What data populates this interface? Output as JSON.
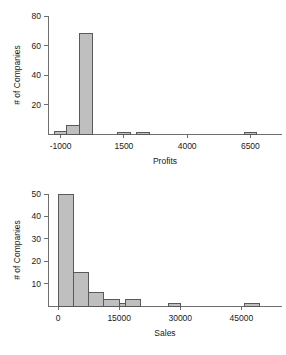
{
  "figure": {
    "title": "",
    "background": "#ffffff",
    "bar_fill": "#bfbfbf",
    "bar_stroke": "#595959",
    "axis_color": "#6e6e6e"
  },
  "chart_data": [
    {
      "id": "profits",
      "type": "bar",
      "title": "",
      "xlabel": "Profits",
      "ylabel": "# of Companies",
      "grid": false,
      "legend": "none",
      "xlim": [
        -1500,
        7750
      ],
      "ylim": [
        0,
        80
      ],
      "xticks": [
        -1000,
        1500,
        4000,
        6500
      ],
      "xtick_labels": [
        "-1000",
        "1500",
        "4000",
        "6500"
      ],
      "yticks": [
        20,
        40,
        60,
        80
      ],
      "ytick_labels": [
        "20",
        "40",
        "60",
        "80"
      ],
      "bin_width": 500,
      "bins": [
        {
          "x0": -1250,
          "x1": -750,
          "value": 2
        },
        {
          "x0": -750,
          "x1": -250,
          "value": 6
        },
        {
          "x0": -250,
          "x1": 250,
          "value": 68
        },
        {
          "x0": 1250,
          "x1": 1750,
          "value": 1
        },
        {
          "x0": 2000,
          "x1": 2500,
          "value": 1
        },
        {
          "x0": 6250,
          "x1": 6750,
          "value": 1
        }
      ],
      "categories": [
        "-1250 to -750",
        "-750 to -250",
        "-250 to 250",
        "1250 to 1750",
        "2000 to 2500",
        "6250 to 6750"
      ],
      "values": [
        2,
        6,
        68,
        1,
        1,
        1
      ]
    },
    {
      "id": "sales",
      "type": "bar",
      "title": "",
      "xlabel": "Sales",
      "ylabel": "# of Companies",
      "grid": false,
      "legend": "none",
      "xlim": [
        -2500,
        55000
      ],
      "ylim": [
        0,
        50
      ],
      "xticks": [
        0,
        15000,
        30000,
        45000
      ],
      "xtick_labels": [
        "0",
        "15000",
        "30000",
        "45000"
      ],
      "yticks": [
        10,
        20,
        30,
        40,
        50
      ],
      "ytick_labels": [
        "10",
        "20",
        "30",
        "40",
        "50"
      ],
      "bin_width": 3750,
      "bins": [
        {
          "x0": 0,
          "x1": 3750,
          "value": 50
        },
        {
          "x0": 3750,
          "x1": 7500,
          "value": 15
        },
        {
          "x0": 7500,
          "x1": 11250,
          "value": 6
        },
        {
          "x0": 11250,
          "x1": 15000,
          "value": 3
        },
        {
          "x0": 15000,
          "x1": 16500,
          "value": 1
        },
        {
          "x0": 16500,
          "x1": 20250,
          "value": 3
        },
        {
          "x0": 27000,
          "x1": 30000,
          "value": 1
        },
        {
          "x0": 45750,
          "x1": 49500,
          "value": 1
        }
      ],
      "categories": [
        "0 to 3750",
        "3750 to 7500",
        "7500 to 11250",
        "11250 to 15000",
        "15000 to 16500",
        "16500 to 20250",
        "27000 to 30000",
        "45750 to 49500"
      ],
      "values": [
        50,
        15,
        6,
        3,
        1,
        3,
        1,
        1
      ]
    }
  ]
}
